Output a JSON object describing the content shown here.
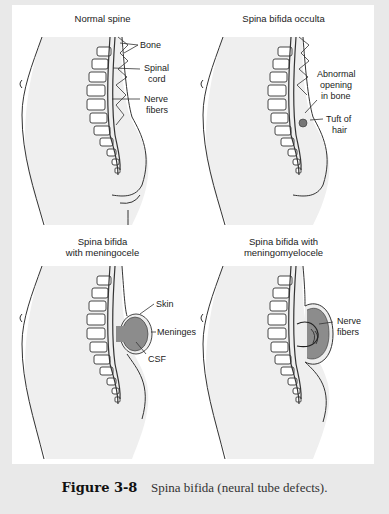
{
  "figure": {
    "number": "Figure 3-8",
    "caption": "Spina bifida (neural tube defects)."
  },
  "panels": [
    {
      "title": "Normal spine",
      "labels": [
        "Bone",
        "Spinal cord",
        "Nerve fibers"
      ],
      "label_lines": {
        "bone": "Bone",
        "spinal_1": "Spinal",
        "spinal_2": "cord",
        "nerve_1": "Nerve",
        "nerve_2": "fibers"
      }
    },
    {
      "title": "Spina bifida occulta",
      "labels": [
        "Abnormal opening in bone",
        "Tuft of hair"
      ],
      "label_lines": {
        "abn_1": "Abnormal",
        "abn_2": "opening",
        "abn_3": "in bone",
        "tuft_1": "Tuft of",
        "tuft_2": "hair"
      }
    },
    {
      "title": "Spina bifida with meningocele",
      "title_lines": {
        "l1": "Spina bifida",
        "l2": "with meningocele"
      },
      "labels": [
        "Skin",
        "Meninges",
        "CSF"
      ],
      "label_lines": {
        "skin": "Skin",
        "meninges": "Meninges",
        "csf": "CSF"
      }
    },
    {
      "title": "Spina bifida with meningomyelocele",
      "title_lines": {
        "l1": "Spina bifida with",
        "l2": "meningomyelocele"
      },
      "labels": [
        "Nerve fibers"
      ],
      "label_lines": {
        "nerve_1": "Nerve",
        "nerve_2": "fibers"
      }
    }
  ],
  "colors": {
    "background": "#e9e9e9",
    "panel": "#ffffff",
    "body_fill": "#efefef",
    "line": "#333333",
    "sac_fill": "#8c8c8c"
  }
}
